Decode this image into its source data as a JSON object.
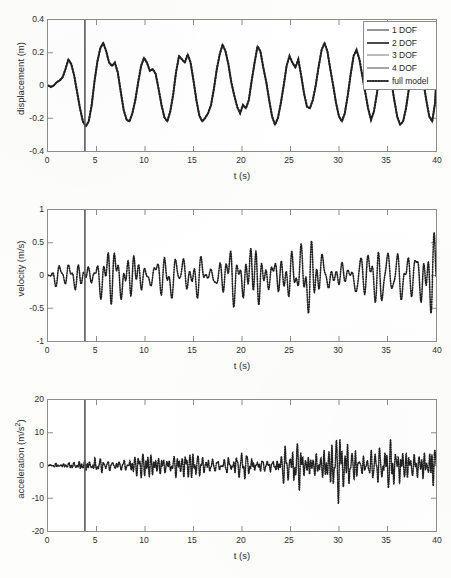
{
  "figure": {
    "background": "#fdfdfb",
    "axis_color": "#8d8d8d",
    "text_color": "#2b2b2b"
  },
  "legend": {
    "position": "top-right",
    "entries": [
      {
        "label": "1 DOF",
        "style": "solid",
        "color": "#8a8a8a"
      },
      {
        "label": "2 DOF",
        "style": "solid",
        "color": "#4a4a4a"
      },
      {
        "label": "3 DOF",
        "style": "solid",
        "color": "#b4b4b4"
      },
      {
        "label": "4 DOF",
        "style": "solid",
        "color": "#9c9c9c"
      },
      {
        "label": "full model",
        "style": "dotted",
        "color": "#2a2a2a"
      }
    ]
  },
  "marker_line": {
    "t": 3.8,
    "color": "#5a5a5a",
    "label": "vertical-event-marker"
  },
  "chart_data": [
    {
      "id": "displacement",
      "type": "line",
      "title": "",
      "xlabel": "t (s)",
      "ylabel": "displacement (m)",
      "xlim": [
        0,
        40
      ],
      "ylim": [
        -0.4,
        0.4
      ],
      "xticks": [
        0,
        5,
        10,
        15,
        20,
        25,
        30,
        35,
        40
      ],
      "yticks": [
        -0.4,
        -0.2,
        0,
        0.2,
        0.4
      ],
      "xtick_labels": [
        "0",
        "5",
        "10",
        "15",
        "20",
        "25",
        "30",
        "35",
        "40"
      ],
      "ytick_labels": [
        "-0.4",
        "-0.2",
        "0",
        "0.2",
        "0.4"
      ],
      "grid": false,
      "legend_position": "upper right",
      "series": [
        {
          "name": "full model",
          "style": "dotted",
          "x": [
            0.0,
            0.3,
            0.6,
            0.9,
            1.2,
            1.5,
            1.8,
            2.1,
            2.4,
            2.7,
            3.0,
            3.3,
            3.6,
            3.9,
            4.2,
            4.5,
            4.8,
            5.1,
            5.4,
            5.7,
            6.0,
            6.3,
            6.6,
            6.9,
            7.2,
            7.5,
            7.8,
            8.1,
            8.4,
            8.7,
            9.0,
            9.3,
            9.6,
            9.9,
            10.2,
            10.5,
            10.8,
            11.1,
            11.4,
            11.7,
            12.0,
            12.3,
            12.6,
            12.9,
            13.2,
            13.5,
            13.8,
            14.1,
            14.4,
            14.7,
            15.0,
            15.3,
            15.6,
            15.9,
            16.2,
            16.5,
            16.8,
            17.1,
            17.4,
            17.7,
            18.0,
            18.3,
            18.6,
            18.9,
            19.2,
            19.5,
            19.8,
            20.1,
            20.4,
            20.7,
            21.0,
            21.3,
            21.6,
            21.9,
            22.2,
            22.5,
            22.8,
            23.1,
            23.4,
            23.7,
            24.0,
            24.3,
            24.6,
            24.9,
            25.2,
            25.5,
            25.8,
            26.1,
            26.4,
            26.7,
            27.0,
            27.3,
            27.6,
            27.9,
            28.2,
            28.5,
            28.8,
            29.1,
            29.4,
            29.7,
            30.0,
            30.3,
            30.6,
            30.9,
            31.2,
            31.5,
            31.8,
            32.1,
            32.4,
            32.7,
            33.0,
            33.3,
            33.6,
            33.9,
            34.2,
            34.5,
            34.8,
            35.1,
            35.4,
            35.7,
            36.0,
            36.3,
            36.6,
            36.9,
            37.2,
            37.5,
            37.8,
            38.1,
            38.4,
            38.7,
            39.0,
            39.3,
            39.6,
            39.9,
            40.0
          ],
          "y": [
            0.0,
            -0.01,
            0.0,
            0.02,
            0.03,
            0.05,
            0.1,
            0.16,
            0.13,
            0.06,
            -0.04,
            -0.14,
            -0.22,
            -0.25,
            -0.22,
            -0.12,
            0.03,
            0.15,
            0.23,
            0.26,
            0.21,
            0.14,
            0.12,
            0.14,
            0.08,
            -0.04,
            -0.15,
            -0.21,
            -0.22,
            -0.17,
            -0.09,
            0.02,
            0.12,
            0.17,
            0.14,
            0.09,
            0.1,
            0.07,
            -0.02,
            -0.12,
            -0.19,
            -0.21,
            -0.16,
            -0.06,
            0.08,
            0.18,
            0.16,
            0.14,
            0.19,
            0.15,
            0.04,
            -0.08,
            -0.18,
            -0.22,
            -0.2,
            -0.17,
            -0.12,
            -0.02,
            0.1,
            0.19,
            0.25,
            0.22,
            0.13,
            0.02,
            -0.06,
            -0.13,
            -0.17,
            -0.12,
            -0.14,
            -0.09,
            0.03,
            0.15,
            0.24,
            0.21,
            0.11,
            0.02,
            -0.09,
            -0.19,
            -0.23,
            -0.2,
            -0.11,
            0.01,
            0.12,
            0.18,
            0.15,
            0.13,
            0.16,
            0.11,
            0.0,
            -0.11,
            -0.18,
            -0.19,
            -0.14,
            -0.05,
            0.07,
            0.17,
            0.22,
            0.19,
            0.11,
            0.01,
            -0.1,
            -0.19,
            -0.23,
            -0.19,
            -0.1,
            0.02,
            0.13,
            0.2,
            0.22,
            0.17,
            0.08,
            -0.05,
            -0.17,
            -0.24,
            -0.26,
            -0.22,
            -0.13,
            -0.02,
            0.08,
            0.14,
            0.13,
            0.08,
            0.02,
            -0.07,
            -0.16,
            -0.23,
            -0.25,
            -0.21,
            -0.12,
            -0.01,
            0.08,
            0.11
          ]
        }
      ]
    },
    {
      "id": "velocity",
      "type": "line",
      "title": "",
      "xlabel": "t (s)",
      "ylabel": "velocity (m/s)",
      "xlim": [
        0,
        40
      ],
      "ylim": [
        -1,
        1
      ],
      "xticks": [
        0,
        5,
        10,
        15,
        20,
        25,
        30,
        35,
        40
      ],
      "yticks": [
        -1,
        -0.5,
        0,
        0.5,
        1
      ],
      "xtick_labels": [
        "0",
        "5",
        "10",
        "15",
        "20",
        "25",
        "30",
        "35",
        "40"
      ],
      "ytick_labels": [
        "-1",
        "-0.5",
        "0",
        "0.5",
        "1"
      ],
      "grid": false,
      "legend_position": "none",
      "series": [
        {
          "name": "full model",
          "style": "dotted",
          "envelope_note": "broadband oscillation, amplitude roughly 0.2 early rising to 0.9 peak",
          "peak_positive": 0.93,
          "peak_negative": -0.92,
          "dominant_period_s": 1.2
        }
      ]
    },
    {
      "id": "acceleration",
      "type": "line",
      "title": "",
      "xlabel": "t (s)",
      "ylabel": "acceleration (m/s 2)",
      "xlim": [
        0,
        40
      ],
      "ylim": [
        -20,
        20
      ],
      "xticks": [
        0,
        5,
        10,
        15,
        20,
        25,
        30,
        35,
        40
      ],
      "yticks": [
        -20,
        -10,
        0,
        10,
        20
      ],
      "xtick_labels": [
        "0",
        "5",
        "10",
        "15",
        "20",
        "25",
        "30",
        "35",
        "40"
      ],
      "ytick_labels": [
        "-20",
        "-10",
        "0",
        "10",
        "20"
      ],
      "grid": false,
      "legend_position": "none",
      "series": [
        {
          "name": "full model",
          "style": "dotted",
          "envelope_note": "high-frequency oscillation with envelope growing from ~2 at t=2 to ~11 at t=38",
          "peak_positive": 11.5,
          "peak_negative": -12.5,
          "dominant_period_s": 0.32
        }
      ]
    }
  ]
}
